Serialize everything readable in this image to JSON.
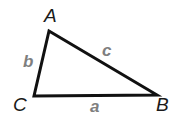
{
  "diagram": {
    "type": "triangle",
    "stroke_color": "#111111",
    "vertex_label_color": "#1a1a1a",
    "side_label_color": "#7f7f7f",
    "vertices": [
      {
        "label": "A",
        "x": 49,
        "y": 31
      },
      {
        "label": "B",
        "x": 157,
        "y": 95
      },
      {
        "label": "C",
        "x": 34,
        "y": 96
      }
    ],
    "sides": [
      {
        "label": "a",
        "from": "C",
        "to": "B"
      },
      {
        "label": "b",
        "from": "C",
        "to": "A"
      },
      {
        "label": "c",
        "from": "A",
        "to": "B"
      }
    ]
  }
}
